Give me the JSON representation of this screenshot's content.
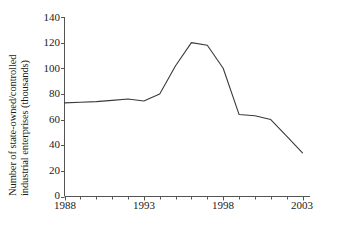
{
  "chart_data": {
    "type": "line",
    "title": "",
    "xlabel": "",
    "ylabel": "Number of state-owned/controlled industrial enterprises (thousands)",
    "ylabel_lines": [
      "Number of state-owned/controlled",
      "industrial enterprises (thousands)"
    ],
    "xlim": [
      1988,
      2003
    ],
    "ylim": [
      0,
      140
    ],
    "yticks": [
      0,
      20,
      40,
      60,
      80,
      100,
      120,
      140
    ],
    "ytick_labels": [
      "0",
      "20",
      "40",
      "60",
      "80",
      "100",
      "120",
      "140"
    ],
    "xticks": [
      1988,
      1993,
      1998,
      2003
    ],
    "xtick_labels": [
      "1988",
      "1993",
      "1998",
      "2003"
    ],
    "x_minor_tick_step": 1,
    "grid": false,
    "legend": false,
    "markers": false,
    "line_color": "#3a3a3a",
    "axis_color": "#555555",
    "background": "#ffffff",
    "x": [
      1988,
      1989,
      1990,
      1991,
      1992,
      1993,
      1994,
      1995,
      1996,
      1997,
      1998,
      1999,
      2000,
      2001,
      2002,
      2003
    ],
    "values": [
      73,
      73.5,
      74,
      75,
      76,
      74.5,
      80,
      102,
      120,
      118,
      100,
      64,
      63,
      60,
      47,
      34
    ],
    "series": [
      {
        "name": "Number of state-owned/controlled industrial enterprises",
        "values": [
          73,
          73.5,
          74,
          75,
          76,
          74.5,
          80,
          102,
          120,
          118,
          100,
          64,
          63,
          60,
          47,
          34
        ]
      }
    ]
  }
}
